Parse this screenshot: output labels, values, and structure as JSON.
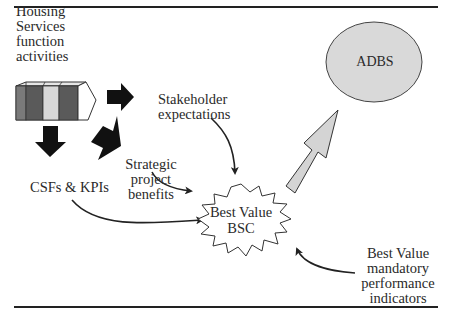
{
  "diagram": {
    "nodes": {
      "housing": {
        "lines": [
          "Housing",
          "Services",
          "function",
          "activities"
        ]
      },
      "stakeholder": {
        "lines": [
          "Stakeholder",
          "expectations"
        ]
      },
      "strategic": {
        "lines": [
          "Strategic",
          "project",
          "benefits"
        ]
      },
      "csfs": {
        "lines": [
          "CSFs & KPIs"
        ]
      },
      "bsc": {
        "lines": [
          "Best Value",
          "BSC"
        ]
      },
      "adbs": {
        "label": "ADBS"
      },
      "mandatory": {
        "lines": [
          "Best Value",
          "mandatory",
          "performance",
          "indicators"
        ]
      }
    },
    "edges": [
      {
        "from": "housing",
        "to": "stakeholder",
        "style": "block-arrow"
      },
      {
        "from": "housing",
        "to": "csfs",
        "style": "block-arrow"
      },
      {
        "from": "housing",
        "to": "strategic",
        "style": "block-arrow"
      },
      {
        "from": "stakeholder",
        "to": "bsc",
        "style": "curved-line"
      },
      {
        "from": "strategic",
        "to": "bsc",
        "style": "curved-line"
      },
      {
        "from": "csfs",
        "to": "bsc",
        "style": "curved-line"
      },
      {
        "from": "mandatory",
        "to": "bsc",
        "style": "curved-line"
      },
      {
        "from": "bsc",
        "to": "adbs",
        "style": "hollow-block-arrow"
      }
    ],
    "colors": {
      "ink": "#222222",
      "circle_fill": "#d9d9d9",
      "arrow_fill": "#d4d4d4",
      "block_dark": "#555555",
      "block_light": "#cfcfcf"
    }
  }
}
